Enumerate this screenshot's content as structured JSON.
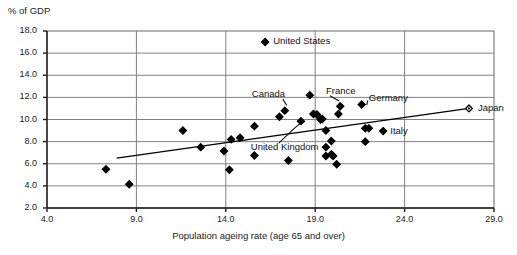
{
  "chart_data": {
    "type": "scatter",
    "title": "",
    "ylabel": "% of GDP",
    "xlabel": "Population ageing rate (age 65 and over)",
    "xlim": [
      4.0,
      29.0
    ],
    "ylim": [
      2.0,
      18.0
    ],
    "xticks": [
      "4.0",
      "9.0",
      "14.0",
      "19.0",
      "24.0",
      "29.0"
    ],
    "yticks": [
      "2.0",
      "4.0",
      "6.0",
      "8.0",
      "10.0",
      "12.0",
      "14.0",
      "16.0",
      "18.0"
    ],
    "grid": "horizontal-and-vertical",
    "legend_position": "inside-top-center",
    "legend": [
      {
        "name": "United States",
        "marker": "filled-diamond"
      }
    ],
    "marker_color": "#000000",
    "trendline_color": "#000000",
    "frame_color": "#808080",
    "points": [
      {
        "x": 7.3,
        "y": 5.5,
        "marker": "filled-diamond"
      },
      {
        "x": 8.6,
        "y": 4.15,
        "marker": "filled-diamond"
      },
      {
        "x": 11.6,
        "y": 9.0,
        "marker": "filled-diamond"
      },
      {
        "x": 12.6,
        "y": 7.5,
        "marker": "filled-diamond"
      },
      {
        "x": 13.9,
        "y": 7.15,
        "marker": "filled-diamond"
      },
      {
        "x": 14.2,
        "y": 5.45,
        "marker": "filled-diamond"
      },
      {
        "x": 14.3,
        "y": 8.2,
        "marker": "filled-diamond"
      },
      {
        "x": 14.8,
        "y": 8.35,
        "marker": "filled-diamond"
      },
      {
        "x": 15.6,
        "y": 9.4,
        "marker": "filled-diamond"
      },
      {
        "x": 15.6,
        "y": 6.75,
        "marker": "filled-diamond"
      },
      {
        "x": 17.0,
        "y": 10.25,
        "marker": "filled-diamond"
      },
      {
        "x": 17.3,
        "y": 10.8,
        "marker": "filled-diamond"
      },
      {
        "x": 17.5,
        "y": 6.3,
        "marker": "filled-diamond"
      },
      {
        "x": 18.2,
        "y": 9.85,
        "marker": "filled-diamond"
      },
      {
        "x": 18.7,
        "y": 12.2,
        "marker": "filled-diamond"
      },
      {
        "x": 18.9,
        "y": 10.5,
        "marker": "filled-diamond"
      },
      {
        "x": 19.1,
        "y": 10.45,
        "marker": "filled-diamond"
      },
      {
        "x": 19.3,
        "y": 10.0,
        "marker": "filled-diamond"
      },
      {
        "x": 19.4,
        "y": 10.05,
        "marker": "filled-diamond"
      },
      {
        "x": 19.6,
        "y": 9.0,
        "marker": "filled-diamond"
      },
      {
        "x": 19.6,
        "y": 7.5,
        "marker": "filled-diamond"
      },
      {
        "x": 19.6,
        "y": 6.7,
        "marker": "filled-diamond"
      },
      {
        "x": 19.9,
        "y": 8.05,
        "marker": "filled-diamond"
      },
      {
        "x": 19.9,
        "y": 6.85,
        "marker": "filled-diamond"
      },
      {
        "x": 20.0,
        "y": 6.7,
        "marker": "filled-diamond"
      },
      {
        "x": 20.2,
        "y": 5.95,
        "marker": "filled-diamond"
      },
      {
        "x": 20.3,
        "y": 10.5,
        "marker": "filled-diamond"
      },
      {
        "x": 20.4,
        "y": 11.2,
        "marker": "filled-diamond"
      },
      {
        "x": 21.6,
        "y": 11.35,
        "marker": "filled-diamond"
      },
      {
        "x": 21.8,
        "y": 9.2,
        "marker": "filled-diamond"
      },
      {
        "x": 22.0,
        "y": 9.2,
        "marker": "filled-diamond"
      },
      {
        "x": 21.8,
        "y": 8.0,
        "marker": "filled-diamond"
      },
      {
        "x": 22.8,
        "y": 8.95,
        "marker": "filled-diamond"
      },
      {
        "x": 27.6,
        "y": 11.0,
        "marker": "hollow-diamond"
      }
    ],
    "annotations": [
      {
        "label": "Canada",
        "lx": 17.3,
        "ly": 12.3,
        "anchor": "end",
        "leader": true,
        "tx": 17.3,
        "ty": 10.9
      },
      {
        "label": "France",
        "lx": 19.6,
        "ly": 12.6,
        "anchor": "start",
        "leader": true,
        "tx": 20.4,
        "ty": 11.3
      },
      {
        "label": "Germany",
        "lx": 22.0,
        "ly": 11.9,
        "anchor": "start",
        "leader": true,
        "tx": 21.6,
        "ty": 11.4
      },
      {
        "label": "Japan",
        "lx": 28.1,
        "ly": 11.0,
        "anchor": "start",
        "leader": false,
        "tx": 27.6,
        "ty": 11.0
      },
      {
        "label": "Italy",
        "lx": 23.2,
        "ly": 8.95,
        "anchor": "start",
        "leader": false,
        "tx": 22.8,
        "ty": 8.95
      },
      {
        "label": "United Kingdom",
        "lx": 15.4,
        "ly": 7.5,
        "anchor": "start",
        "leader": true,
        "tx": 18.2,
        "ty": 9.9
      }
    ],
    "trendline": {
      "x1": 7.9,
      "y1": 6.5,
      "x2": 27.6,
      "y2": 11.0
    }
  },
  "legend_entry": {
    "label": "United States"
  },
  "axes": {
    "y_title": "% of GDP",
    "x_title": "Population ageing rate (age 65 and over)"
  }
}
